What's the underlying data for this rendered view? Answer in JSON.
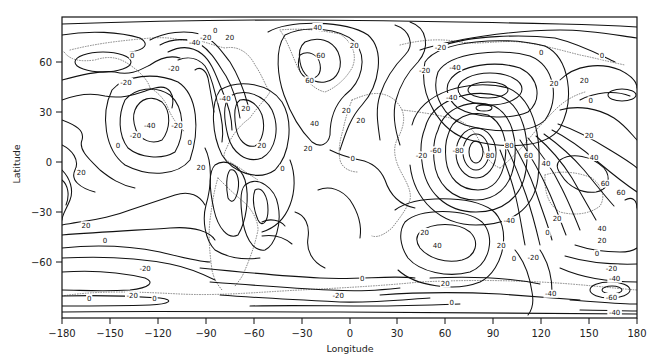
{
  "chart_data": {
    "type": "contour",
    "title": "",
    "xlabel": "Longitude",
    "ylabel": "Latitude",
    "xlim": [
      -180,
      180
    ],
    "ylim": [
      -90,
      90
    ],
    "x_ticks": [
      -180,
      -150,
      -120,
      -90,
      -60,
      -30,
      0,
      30,
      60,
      90,
      120,
      150,
      180
    ],
    "y_ticks": [
      60,
      30,
      0,
      -30,
      -60
    ],
    "contour_interval": 20,
    "contour_levels": [
      -80,
      -60,
      -40,
      -20,
      0,
      20,
      40,
      60,
      80
    ],
    "grid": false,
    "legend": null,
    "overlay": "dotted continental coastlines",
    "labeled_features": [
      {
        "label": "0",
        "lon": -136,
        "lat": 64
      },
      {
        "label": "-20",
        "lon": -140,
        "lat": 48
      },
      {
        "label": "-20",
        "lon": -110,
        "lat": 56
      },
      {
        "label": "-40",
        "lon": -125,
        "lat": 22
      },
      {
        "label": "-20",
        "lon": -134,
        "lat": 16
      },
      {
        "label": "0",
        "lon": -145,
        "lat": 10
      },
      {
        "label": "20",
        "lon": -168,
        "lat": -6
      },
      {
        "label": "20",
        "lon": -165,
        "lat": -38
      },
      {
        "label": "0",
        "lon": -153,
        "lat": -47
      },
      {
        "label": "-20",
        "lon": -128,
        "lat": -64
      },
      {
        "label": "0",
        "lon": -163,
        "lat": -82
      },
      {
        "label": "0",
        "lon": -122,
        "lat": -82
      },
      {
        "label": "-40",
        "lon": -97,
        "lat": 72
      },
      {
        "label": "-20",
        "lon": -90,
        "lat": 75
      },
      {
        "label": "0",
        "lon": -84,
        "lat": 79
      },
      {
        "label": "20",
        "lon": -75,
        "lat": 75
      },
      {
        "label": "-40",
        "lon": -78,
        "lat": 38
      },
      {
        "label": "20",
        "lon": -65,
        "lat": 32
      },
      {
        "label": "-20",
        "lon": -108,
        "lat": 22
      },
      {
        "label": "0",
        "lon": -100,
        "lat": 12
      },
      {
        "label": "20",
        "lon": -93,
        "lat": -3
      },
      {
        "label": "20",
        "lon": -55,
        "lat": 10
      },
      {
        "label": "0",
        "lon": -42,
        "lat": -4
      },
      {
        "label": "40",
        "lon": -20,
        "lat": 81
      },
      {
        "label": "60",
        "lon": -18,
        "lat": 64
      },
      {
        "label": "60",
        "lon": -25,
        "lat": 49
      },
      {
        "label": "40",
        "lon": -22,
        "lat": 23
      },
      {
        "label": "20",
        "lon": -26,
        "lat": 8
      },
      {
        "label": "20",
        "lon": 3,
        "lat": 70
      },
      {
        "label": "20",
        "lon": 7,
        "lat": 25
      },
      {
        "label": "0",
        "lon": 2,
        "lat": 2
      },
      {
        "label": "-20",
        "lon": 57,
        "lat": 69
      },
      {
        "label": "-20",
        "lon": 47,
        "lat": 55
      },
      {
        "label": "-40",
        "lon": 66,
        "lat": 57
      },
      {
        "label": "-40",
        "lon": 64,
        "lat": 39
      },
      {
        "label": "20",
        "lon": -2,
        "lat": 31
      },
      {
        "label": "-20",
        "lon": 45,
        "lat": 4
      },
      {
        "label": "-60",
        "lon": 54,
        "lat": 7
      },
      {
        "label": "-80",
        "lon": 68,
        "lat": 7
      },
      {
        "label": "80",
        "lon": 88,
        "lat": 4
      },
      {
        "label": "80",
        "lon": 100,
        "lat": 10
      },
      {
        "label": "60",
        "lon": 112,
        "lat": 4
      },
      {
        "label": "40",
        "lon": 123,
        "lat": -1
      },
      {
        "label": "0",
        "lon": 120,
        "lat": 66
      },
      {
        "label": "0",
        "lon": 158,
        "lat": 64
      },
      {
        "label": "20",
        "lon": 128,
        "lat": 47
      },
      {
        "label": "20",
        "lon": 147,
        "lat": 49
      },
      {
        "label": "0",
        "lon": 151,
        "lat": 37
      },
      {
        "label": "20",
        "lon": 150,
        "lat": 16
      },
      {
        "label": "40",
        "lon": 153,
        "lat": 3
      },
      {
        "label": "60",
        "lon": 160,
        "lat": -13
      },
      {
        "label": "60",
        "lon": 170,
        "lat": -18
      },
      {
        "label": "-40",
        "lon": 100,
        "lat": -35
      },
      {
        "label": "20",
        "lon": 130,
        "lat": -34
      },
      {
        "label": "0",
        "lon": 124,
        "lat": -42
      },
      {
        "label": "40",
        "lon": 158,
        "lat": -40
      },
      {
        "label": "20",
        "lon": 158,
        "lat": -47
      },
      {
        "label": "0",
        "lon": 155,
        "lat": -55
      },
      {
        "label": "20",
        "lon": 47,
        "lat": -42
      },
      {
        "label": "40",
        "lon": 55,
        "lat": -50
      },
      {
        "label": "20",
        "lon": 60,
        "lat": -73
      },
      {
        "label": "0",
        "lon": 64,
        "lat": -84
      },
      {
        "label": "0",
        "lon": 8,
        "lat": -70
      },
      {
        "label": "-20",
        "lon": -7,
        "lat": -80
      },
      {
        "label": "-20",
        "lon": -136,
        "lat": -80
      },
      {
        "label": "20",
        "lon": 95,
        "lat": -50
      },
      {
        "label": "0",
        "lon": 103,
        "lat": -58
      },
      {
        "label": "-20",
        "lon": 115,
        "lat": -57
      },
      {
        "label": "-40",
        "lon": 126,
        "lat": -79
      },
      {
        "label": "-20",
        "lon": 164,
        "lat": -64
      },
      {
        "label": "-40",
        "lon": 166,
        "lat": -70
      },
      {
        "label": "-60",
        "lon": 164,
        "lat": -81
      },
      {
        "label": "-40",
        "lon": 166,
        "lat": -90
      }
    ]
  },
  "axes": {
    "x_title": "Longitude",
    "y_title": "Latitude",
    "x_tick_labels": [
      "−180",
      "−150",
      "−120",
      "−90",
      "−60",
      "−30",
      "0",
      "30",
      "60",
      "90",
      "120",
      "150",
      "180"
    ],
    "y_tick_labels": [
      "60",
      "30",
      "0",
      "−30",
      "−60"
    ]
  }
}
